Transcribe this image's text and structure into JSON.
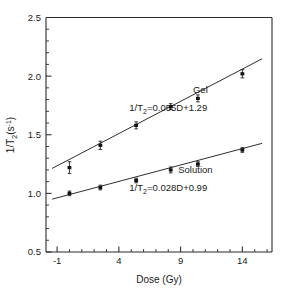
{
  "chart_data": {
    "type": "scatter",
    "title": "",
    "xlabel": "Dose (Gy)",
    "ylabel": "1/T2(s-1)",
    "ylabel_parts": {
      "prefix": "1/T",
      "sub": "2",
      "open": "(s",
      "sup": "-1",
      "close": ")"
    },
    "xlim": [
      -1.9,
      16.4
    ],
    "ylim": [
      0.5,
      2.5
    ],
    "grid": false,
    "legend_position": "inline-annotations",
    "xticks": [
      -1,
      4,
      9,
      14
    ],
    "xticklabels": [
      "-1",
      "4",
      "9",
      "14"
    ],
    "xminor_step": 1,
    "yticks": [
      0.5,
      1.0,
      1.5,
      2.0,
      2.5
    ],
    "yticklabels": [
      "0.5",
      "1.0",
      "1.5",
      "2.0",
      "2.5"
    ],
    "yminor_step": 0.1,
    "series": [
      {
        "name": "Gel",
        "label": "Gel",
        "equation": "1/T2=0.055D+1.29",
        "equation_parts": {
          "prefix": "1/T",
          "sub": "2",
          "rest": "=0.055D+1.29"
        },
        "slope": 0.055,
        "intercept": 1.29,
        "x": [
          0.0,
          2.5,
          5.4,
          8.2,
          10.4,
          14.0
        ],
        "y": [
          1.22,
          1.41,
          1.58,
          1.74,
          1.81,
          2.02
        ],
        "yerr": [
          0.05,
          0.035,
          0.03,
          0.025,
          0.03,
          0.035
        ],
        "fit_x": [
          -1.4,
          15.6
        ],
        "fit_y": [
          1.213,
          2.148
        ]
      },
      {
        "name": "Solution",
        "label": "Solution",
        "equation": "1/T2=0.028D+0.99",
        "equation_parts": {
          "prefix": "1/T",
          "sub": "2",
          "rest": "=0.028D+0.99"
        },
        "slope": 0.028,
        "intercept": 0.99,
        "x": [
          0.0,
          2.5,
          5.4,
          8.2,
          10.4,
          14.0
        ],
        "y": [
          1.0,
          1.05,
          1.11,
          1.2,
          1.25,
          1.37
        ],
        "yerr": [
          0.02,
          0.02,
          0.02,
          0.025,
          0.02,
          0.02
        ],
        "fit_x": [
          -1.4,
          15.6
        ],
        "fit_y": [
          0.951,
          1.427
        ]
      }
    ],
    "annotations": [
      {
        "text": "Gel",
        "x": 10.6,
        "y": 1.86
      },
      {
        "text": "1/T2=0.055D+1.29",
        "x": 8.0,
        "y": 1.7
      },
      {
        "text": "Solution",
        "x": 10.2,
        "y": 1.17
      },
      {
        "text": "1/T2=0.028D+0.99",
        "x": 8.0,
        "y": 1.02
      }
    ]
  }
}
